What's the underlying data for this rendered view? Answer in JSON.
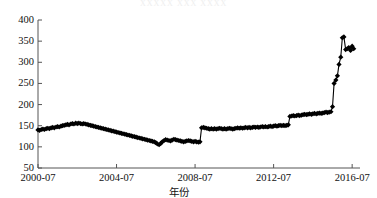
{
  "chart_data": {
    "type": "scatter",
    "title": "",
    "xlabel": "年份",
    "ylabel": "",
    "ylim": [
      50,
      400
    ],
    "ytick_labels": [
      "400",
      "350",
      "300",
      "250",
      "200",
      "150",
      "100",
      "50"
    ],
    "ytick_values": [
      400,
      350,
      300,
      250,
      200,
      150,
      100,
      50
    ],
    "xtick_labels": [
      "2000-07",
      "2004-07",
      "2008-07",
      "2012-07",
      "2016-07"
    ],
    "xtick_values": [
      2000.5,
      2004.5,
      2008.5,
      2012.5,
      2016.5
    ],
    "xlim": [
      2000.5,
      2016.9
    ],
    "grid": false,
    "legend": null,
    "marker": "diamond",
    "marker_color": "#000000",
    "line_color": "#000000",
    "series": [
      {
        "name": "series-1",
        "x": [
          2000.5,
          2000.58,
          2000.67,
          2000.75,
          2000.83,
          2000.92,
          2001.0,
          2001.08,
          2001.17,
          2001.25,
          2001.33,
          2001.42,
          2001.5,
          2001.58,
          2001.67,
          2001.75,
          2001.83,
          2001.92,
          2002.0,
          2002.08,
          2002.17,
          2002.25,
          2002.33,
          2002.42,
          2002.5,
          2002.58,
          2002.67,
          2002.75,
          2002.83,
          2002.92,
          2003.0,
          2003.08,
          2003.17,
          2003.25,
          2003.33,
          2003.42,
          2003.5,
          2003.58,
          2003.67,
          2003.75,
          2003.83,
          2003.92,
          2004.0,
          2004.08,
          2004.17,
          2004.25,
          2004.33,
          2004.42,
          2004.5,
          2004.58,
          2004.67,
          2004.75,
          2004.83,
          2004.92,
          2005.0,
          2005.08,
          2005.17,
          2005.25,
          2005.33,
          2005.42,
          2005.5,
          2005.58,
          2005.67,
          2005.75,
          2005.83,
          2005.92,
          2006.0,
          2006.08,
          2006.17,
          2006.25,
          2006.33,
          2006.42,
          2006.5,
          2006.58,
          2006.67,
          2006.75,
          2006.83,
          2006.92,
          2007.0,
          2007.08,
          2007.17,
          2007.25,
          2007.33,
          2007.42,
          2007.5,
          2007.58,
          2007.67,
          2007.75,
          2007.83,
          2007.92,
          2008.0,
          2008.08,
          2008.17,
          2008.25,
          2008.33,
          2008.42,
          2008.5,
          2008.58,
          2008.67,
          2008.75,
          2008.83,
          2008.92,
          2009.0,
          2009.08,
          2009.17,
          2009.25,
          2009.33,
          2009.42,
          2009.5,
          2009.58,
          2009.67,
          2009.75,
          2009.83,
          2009.92,
          2010.0,
          2010.08,
          2010.17,
          2010.25,
          2010.33,
          2010.42,
          2010.5,
          2010.58,
          2010.67,
          2010.75,
          2010.83,
          2010.92,
          2011.0,
          2011.08,
          2011.17,
          2011.25,
          2011.33,
          2011.42,
          2011.5,
          2011.58,
          2011.67,
          2011.75,
          2011.83,
          2011.92,
          2012.0,
          2012.08,
          2012.17,
          2012.25,
          2012.33,
          2012.42,
          2012.5,
          2012.58,
          2012.67,
          2012.75,
          2012.83,
          2012.92,
          2013.0,
          2013.08,
          2013.17,
          2013.25,
          2013.33,
          2013.42,
          2013.5,
          2013.58,
          2013.67,
          2013.75,
          2013.83,
          2013.92,
          2014.0,
          2014.08,
          2014.17,
          2014.25,
          2014.33,
          2014.42,
          2014.5,
          2014.58,
          2014.67,
          2014.75,
          2014.83,
          2014.92,
          2015.0,
          2015.08,
          2015.17,
          2015.25,
          2015.33,
          2015.42,
          2015.5,
          2015.58,
          2015.67,
          2015.75,
          2015.83,
          2015.92,
          2016.0,
          2016.08,
          2016.17,
          2016.25,
          2016.33,
          2016.42,
          2016.5,
          2016.58
        ],
        "y": [
          140,
          139,
          141,
          142,
          141,
          143,
          144,
          143,
          145,
          146,
          145,
          147,
          148,
          147,
          149,
          150,
          151,
          152,
          153,
          152,
          154,
          155,
          154,
          156,
          155,
          156,
          155,
          154,
          155,
          154,
          153,
          152,
          151,
          150,
          149,
          148,
          147,
          146,
          145,
          144,
          143,
          142,
          141,
          140,
          139,
          138,
          137,
          136,
          135,
          134,
          133,
          132,
          131,
          130,
          129,
          128,
          127,
          126,
          125,
          124,
          123,
          122,
          121,
          120,
          119,
          118,
          117,
          116,
          115,
          114,
          113,
          112,
          110,
          107,
          105,
          108,
          112,
          115,
          117,
          116,
          115,
          114,
          116,
          118,
          117,
          116,
          115,
          114,
          113,
          112,
          113,
          114,
          115,
          114,
          113,
          112,
          113,
          112,
          111,
          112,
          145,
          146,
          145,
          144,
          143,
          142,
          143,
          142,
          143,
          142,
          143,
          144,
          143,
          142,
          143,
          142,
          143,
          144,
          143,
          142,
          143,
          144,
          145,
          144,
          145,
          144,
          145,
          146,
          145,
          146,
          145,
          146,
          147,
          146,
          147,
          146,
          147,
          148,
          147,
          148,
          147,
          148,
          149,
          148,
          149,
          150,
          149,
          150,
          151,
          150,
          151,
          150,
          151,
          152,
          172,
          173,
          174,
          173,
          174,
          175,
          174,
          175,
          176,
          177,
          176,
          177,
          178,
          177,
          178,
          179,
          178,
          179,
          180,
          179,
          180,
          181,
          182,
          181,
          182,
          183,
          195,
          250,
          258,
          268,
          295,
          312,
          358,
          360,
          330,
          332,
          335,
          328,
          338,
          332
        ]
      }
    ],
    "annotations": [
      {
        "label": "step-up-2008",
        "x": 2008.92,
        "from": 112,
        "to": 145
      },
      {
        "label": "step-up-2013",
        "x": 2013.0,
        "from": 152,
        "to": 172
      },
      {
        "label": "spike-2015-2016",
        "x": 2015.92,
        "from": 195,
        "to": 360
      }
    ]
  },
  "axes": {
    "x_ticks": [
      "2000-07",
      "2004-07",
      "2008-07",
      "2012-07",
      "2016-07"
    ],
    "y_ticks": [
      "400",
      "350",
      "300",
      "250",
      "200",
      "150",
      "100",
      "50"
    ],
    "x_axis_title": "年份"
  },
  "ghost_text": "XXXXX XXX XXXX"
}
